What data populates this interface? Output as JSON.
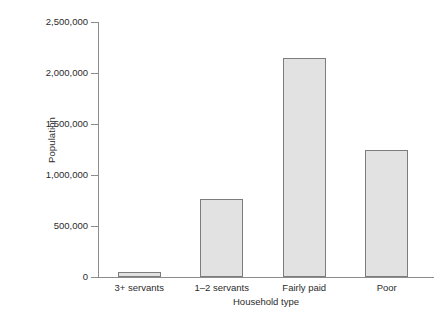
{
  "chart_data": {
    "type": "bar",
    "title": "",
    "xlabel": "Household type",
    "ylabel": "Population",
    "categories": [
      "3+ servants",
      "1–2 servants",
      "Fairly paid",
      "Poor"
    ],
    "values": [
      50000,
      765000,
      2150000,
      1245000
    ],
    "ylim": [
      0,
      2500000
    ],
    "yticks": [
      0,
      500000,
      1000000,
      1500000,
      2000000,
      2500000
    ],
    "ytick_labels": [
      "0",
      "500,000",
      "1,000,000",
      "1,500,000",
      "2,000,000",
      "2,500,000"
    ],
    "grid": false,
    "legend": null,
    "colors": {
      "bar_fill": "#e2e2e2",
      "bar_edge": "#7d7d7d",
      "axis": "#8c8c8c",
      "text": "#2b2b2b",
      "background": "#ffffff"
    }
  }
}
